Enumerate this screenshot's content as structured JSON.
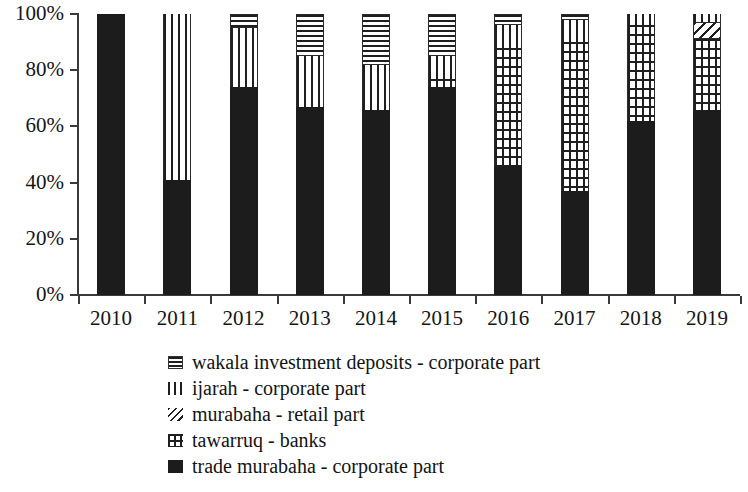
{
  "chart_data": {
    "type": "bar",
    "subtype": "stacked-percent",
    "title": "",
    "xlabel": "",
    "ylabel": "",
    "ylim": [
      0,
      100
    ],
    "ytick_labels": [
      "100%",
      "80%",
      "60%",
      "40%",
      "20%",
      "0%"
    ],
    "ytick_values": [
      100,
      80,
      60,
      40,
      20,
      0
    ],
    "grid": false,
    "legend_position": "bottom-center",
    "categories": [
      "2010",
      "2011",
      "2012",
      "2013",
      "2014",
      "2015",
      "2016",
      "2017",
      "2018",
      "2019"
    ],
    "series": [
      {
        "name": "trade murabaha - corporate part",
        "pattern": "solid",
        "color": "#1c1c1c",
        "values": [
          100,
          41,
          74,
          67,
          66,
          74,
          46,
          37,
          62,
          66
        ]
      },
      {
        "name": "tawarruq - banks",
        "pattern": "grid",
        "color": "#1f1f1f",
        "values": [
          0,
          0,
          0,
          0,
          0,
          3,
          42,
          53,
          34,
          25
        ]
      },
      {
        "name": "murabaha - retail part",
        "pattern": "diagonal",
        "color": "#1f1f1f",
        "values": [
          0,
          0,
          0,
          0,
          0,
          0,
          0,
          0,
          0,
          6
        ]
      },
      {
        "name": "ijarah - corporate part",
        "pattern": "vertical",
        "color": "#1f1f1f",
        "values": [
          0,
          59,
          21,
          18,
          16,
          8,
          8,
          8,
          4,
          3
        ]
      },
      {
        "name": "wakala investment deposits - corporate part",
        "pattern": "horizontal",
        "color": "#1f1f1f",
        "values": [
          0,
          0,
          5,
          15,
          18,
          15,
          4,
          2,
          0,
          0
        ]
      }
    ]
  },
  "axis": {
    "y_ticks": [
      {
        "label": "100%",
        "value": 100
      },
      {
        "label": "80%",
        "value": 80
      },
      {
        "label": "60%",
        "value": 60
      },
      {
        "label": "40%",
        "value": 40
      },
      {
        "label": "20%",
        "value": 20
      },
      {
        "label": "0%",
        "value": 0
      }
    ],
    "x_ticks": [
      "2010",
      "2011",
      "2012",
      "2013",
      "2014",
      "2015",
      "2016",
      "2017",
      "2018",
      "2019"
    ]
  },
  "legend": {
    "items": [
      {
        "label": "wakala investment deposits - corporate part",
        "pattern": "horizontal",
        "key_name": "legend-key-horizontal-lines"
      },
      {
        "label": "ijarah - corporate part",
        "pattern": "vertical",
        "key_name": "legend-key-vertical-lines"
      },
      {
        "label": "murabaha - retail part",
        "pattern": "diagonal",
        "key_name": "legend-key-diagonal-lines"
      },
      {
        "label": "tawarruq - banks",
        "pattern": "grid",
        "key_name": "legend-key-grid-lines"
      },
      {
        "label": "trade murabaha - corporate part",
        "pattern": "solid",
        "key_name": "legend-key-solid-black"
      }
    ]
  }
}
